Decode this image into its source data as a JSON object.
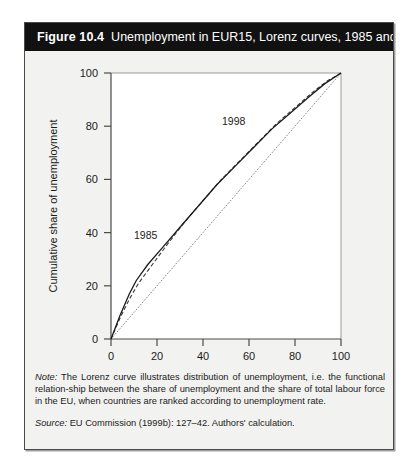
{
  "figure": {
    "number_label": "Figure 10.4",
    "title": "Unemployment in EUR15, Lorenz curves, 1985 and 1998"
  },
  "note": {
    "label": "Note:",
    "text": " The Lorenz curve illustrates distribution of unemployment, i.e. the functional relation-ship between the share of unemployment and the share of total labour force in the EU, when countries are ranked according to unemployment rate."
  },
  "source": {
    "label": "Source:",
    "text": " EU Commission (1999b): 127–42. Authors' calculation."
  },
  "chart_data": {
    "type": "line",
    "title": "Unemployment in EUR15, Lorenz curves, 1985 and 1998",
    "xlabel": "Cumulative share of labour force",
    "ylabel": "Cumulative share of unemployment",
    "xlim": [
      0,
      100
    ],
    "ylim": [
      0,
      100
    ],
    "xticks": [
      0,
      20,
      40,
      60,
      80,
      100
    ],
    "yticks": [
      0,
      20,
      40,
      60,
      80,
      100
    ],
    "grid": false,
    "legend_position": "inline-annotation",
    "annotations": [
      {
        "text": "1985",
        "x": 9,
        "y": 38,
        "target": "1985 solid curve"
      },
      {
        "text": "1998",
        "x": 46,
        "y": 74,
        "target": "1998 dashed curve"
      }
    ],
    "series": [
      {
        "name": "1985",
        "style": "solid",
        "color": "#1b1b1b",
        "x": [
          0,
          4,
          8,
          11,
          16,
          22,
          30,
          38,
          46,
          54,
          62,
          70,
          78,
          86,
          93,
          100
        ],
        "y": [
          0,
          9,
          17,
          22,
          28,
          34,
          42,
          50,
          58,
          65,
          72,
          79,
          85,
          91,
          96,
          100
        ]
      },
      {
        "name": "1998",
        "style": "dashed",
        "color": "#3a3a3a",
        "x": [
          0,
          4,
          8,
          12,
          18,
          24,
          32,
          40,
          48,
          56,
          64,
          72,
          80,
          88,
          94,
          100
        ],
        "y": [
          0,
          8,
          15,
          21,
          28,
          35,
          44,
          52,
          60,
          67,
          74,
          81,
          87,
          93,
          97,
          100
        ]
      },
      {
        "name": "line of equality",
        "style": "dotted",
        "color": "#8c8c8c",
        "x": [
          0,
          100
        ],
        "y": [
          0,
          100
        ]
      }
    ]
  }
}
